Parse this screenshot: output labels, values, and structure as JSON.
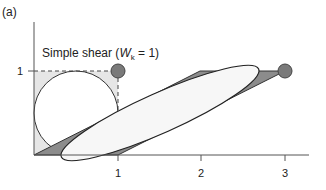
{
  "panel_label": "(a)",
  "annotation": {
    "prefix": "Simple shear (",
    "var": "W",
    "sub": "k",
    "suffix": " = 1)"
  },
  "axes": {
    "x_ticks": [
      "1",
      "2",
      "3"
    ],
    "y_ticks": [
      "1"
    ]
  },
  "colors": {
    "square_fill": "#e6e6e6",
    "parallelogram_fill": "#8c8c8c",
    "ellipse_fill": "#f7f7f7",
    "marker_fill": "#7a7a7a",
    "line": "#333333"
  }
}
